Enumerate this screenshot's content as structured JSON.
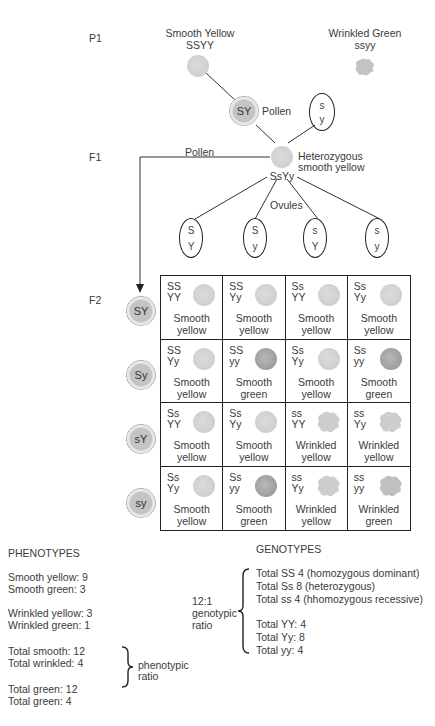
{
  "generations": {
    "p1": "P1",
    "f1": "F1",
    "f2": "F2"
  },
  "parents": {
    "smooth_yellow": {
      "name": "Smooth Yellow",
      "genotype": "SSYY"
    },
    "wrinkled_green": {
      "name": "Wrinkled Green",
      "genotype": "ssyy"
    }
  },
  "gametes_p1": {
    "pollen": {
      "allele": "SY",
      "label": "Pollen"
    },
    "ovule": {
      "top": "s",
      "bottom": "y"
    }
  },
  "f1": {
    "description_line1": "Heterozygous",
    "description_line2": "smooth yellow",
    "genotype": "SsYy",
    "pollen_label": "Pollen",
    "ovules_label": "Ovules"
  },
  "ovules": [
    {
      "top": "S",
      "bottom": "Y"
    },
    {
      "top": "S",
      "bottom": "y"
    },
    {
      "top": "s",
      "bottom": "Y"
    },
    {
      "top": "s",
      "bottom": "y"
    }
  ],
  "pollen_f2": [
    "SY",
    "Sy",
    "sY",
    "sy"
  ],
  "punnett": [
    {
      "g1": "SS",
      "g2": "YY",
      "p1": "Smooth",
      "p2": "yellow",
      "type": "smooth-yellow"
    },
    {
      "g1": "SS",
      "g2": "Yy",
      "p1": "Smooth",
      "p2": "yellow",
      "type": "smooth-yellow"
    },
    {
      "g1": "Ss",
      "g2": "YY",
      "p1": "Smooth",
      "p2": "yellow",
      "type": "smooth-yellow"
    },
    {
      "g1": "Ss",
      "g2": "Yy",
      "p1": "Smooth",
      "p2": "yellow",
      "type": "smooth-yellow"
    },
    {
      "g1": "SS",
      "g2": "Yy",
      "p1": "Smooth",
      "p2": "yellow",
      "type": "smooth-yellow"
    },
    {
      "g1": "SS",
      "g2": "yy",
      "p1": "Smooth",
      "p2": "green",
      "type": "smooth-green"
    },
    {
      "g1": "Ss",
      "g2": "Yy",
      "p1": "Smooth",
      "p2": "yellow",
      "type": "smooth-yellow"
    },
    {
      "g1": "Ss",
      "g2": "yy",
      "p1": "Smooth",
      "p2": "green",
      "type": "smooth-green"
    },
    {
      "g1": "Ss",
      "g2": "YY",
      "p1": "Smooth",
      "p2": "yellow",
      "type": "smooth-yellow"
    },
    {
      "g1": "Ss",
      "g2": "Yy",
      "p1": "Smooth",
      "p2": "yellow",
      "type": "smooth-yellow"
    },
    {
      "g1": "ss",
      "g2": "YY",
      "p1": "Wrinkled",
      "p2": "yellow",
      "type": "wrinkled-yellow"
    },
    {
      "g1": "ss",
      "g2": "Yy",
      "p1": "Wrinkled",
      "p2": "yellow",
      "type": "wrinkled-yellow"
    },
    {
      "g1": "Ss",
      "g2": "Yy",
      "p1": "Smooth",
      "p2": "yellow",
      "type": "smooth-yellow"
    },
    {
      "g1": "Ss",
      "g2": "yy",
      "p1": "Smooth",
      "p2": "green",
      "type": "smooth-green"
    },
    {
      "g1": "ss",
      "g2": "Yy",
      "p1": "Wrinkled",
      "p2": "yellow",
      "type": "wrinkled-yellow"
    },
    {
      "g1": "ss",
      "g2": "yy",
      "p1": "Wrinkled",
      "p2": "green",
      "type": "wrinkled-green"
    }
  ],
  "phenotypes": {
    "heading": "PHENOTYPES",
    "lines": [
      "Smooth yellow: 9",
      "Smooth green: 3",
      "Wrinkled yellow: 3",
      "Wrinkled green: 1",
      "Total smooth: 12",
      "Total wrinkled: 4",
      "Total green: 12",
      "Total green: 4"
    ],
    "ratio_label_1": "phenotypic",
    "ratio_label_2": "ratio"
  },
  "genotypes": {
    "heading": "GENOTYPES",
    "ratio_line1": "12:1",
    "ratio_line2": "genotypic",
    "ratio_line3": "ratio",
    "lines": [
      "Total SS 4 (homozygous dominant)",
      "Total Ss 8 (heterozygous)",
      "Total ss 4 (hhomozygous recessive)",
      "Total YY: 4",
      "Total Yy: 8",
      "Total yy: 4"
    ]
  }
}
